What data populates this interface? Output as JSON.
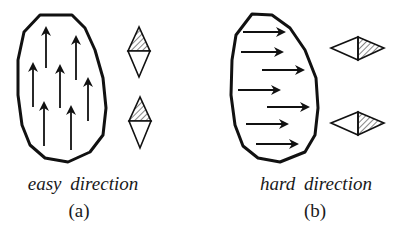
{
  "colors": {
    "stroke": "#111111",
    "background": "#ffffff",
    "hatch": "#333333"
  },
  "panels": [
    {
      "id": "a",
      "direction_label": "easy direction",
      "panel_label": "(a)",
      "arrow_direction": "up",
      "arrow_count": 8,
      "diamond_orientation": "vertical",
      "diamond_count": 2
    },
    {
      "id": "b",
      "direction_label": "hard direction",
      "panel_label": "(b)",
      "arrow_direction": "right",
      "arrow_count": 7,
      "diamond_orientation": "horizontal",
      "diamond_count": 2
    }
  ]
}
